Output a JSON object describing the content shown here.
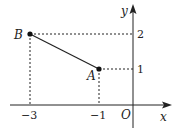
{
  "diagram": {
    "axes": {
      "x_label": "x",
      "y_label": "y",
      "origin_label": "O"
    },
    "ticks": {
      "x": [
        "−3",
        "−1"
      ],
      "y": [
        "2",
        "1"
      ]
    },
    "points": [
      {
        "name": "B",
        "coords": [
          -3,
          2
        ]
      },
      {
        "name": "A",
        "coords": [
          -1,
          1
        ]
      }
    ],
    "segment": "AB",
    "colors": {
      "ink": "#222222",
      "background": "#ffffff"
    }
  }
}
